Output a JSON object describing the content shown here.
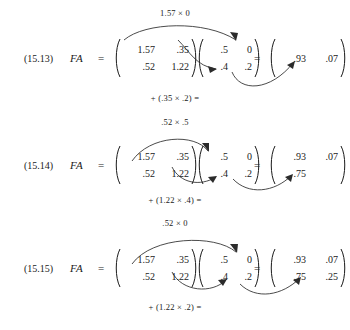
{
  "document": {
    "type": "mathematics-textbook-excerpt",
    "topic": "matrix multiplication step-by-step"
  },
  "symbols": {
    "lhs": "FA",
    "equals": "=",
    "times": "×"
  },
  "equations": [
    {
      "number": "(15.13)",
      "top_label": "1.57 × 0",
      "bottom_label": "+ (.35 × .2) =",
      "matrix_f": {
        "r0c0": "1.57",
        "r0c1": ".35",
        "r1c0": ".52",
        "r1c1": "1.22"
      },
      "matrix_a": {
        "r0c0": ".5",
        "r0c1": "0",
        "r1c0": ".4",
        "r1c1": ".2"
      },
      "result": {
        "r0c0": ".93",
        "r0c1": ".07",
        "r1c0": "",
        "r1c1": ""
      }
    },
    {
      "number": "(15.14)",
      "top_label": ".52 × .5",
      "bottom_label": "+ (1.22 × .4) =",
      "matrix_f": {
        "r0c0": "1.57",
        "r0c1": ".35",
        "r1c0": ".52",
        "r1c1": "1.22"
      },
      "matrix_a": {
        "r0c0": ".5",
        "r0c1": "0",
        "r1c0": ".4",
        "r1c1": ".2"
      },
      "result": {
        "r0c0": ".93",
        "r0c1": ".07",
        "r1c0": ".75",
        "r1c1": ""
      }
    },
    {
      "number": "(15.15)",
      "top_label": ".52 × 0",
      "bottom_label": "+ (1.22 × .2) =",
      "matrix_f": {
        "r0c0": "1.57",
        "r0c1": ".35",
        "r1c0": ".52",
        "r1c1": "1.22"
      },
      "matrix_a": {
        "r0c0": ".5",
        "r0c1": "0",
        "r1c0": ".4",
        "r1c1": ".2"
      },
      "result": {
        "r0c0": ".93",
        "r0c1": ".07",
        "r1c0": ".75",
        "r1c1": ".25"
      }
    }
  ],
  "colors": {
    "ink": "#1a1a1a",
    "arrow": "#2b2b2b",
    "paper": "#ffffff"
  }
}
